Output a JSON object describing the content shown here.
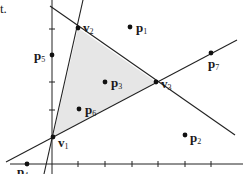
{
  "fragment_text": "t.",
  "polygon": {
    "fill": "#e6e6e6",
    "vertices": [
      {
        "name": "v",
        "sub": "1",
        "x": 53,
        "y": 137
      },
      {
        "name": "v",
        "sub": "2",
        "x": 78,
        "y": 28
      },
      {
        "name": "v",
        "sub": "3",
        "x": 156,
        "y": 82
      }
    ]
  },
  "lines": [
    {
      "id": "line-v1-v2",
      "x1": 44,
      "y1": 174,
      "x2": 83,
      "y2": 0
    },
    {
      "id": "line-v2-v3",
      "x1": 50,
      "y1": 6,
      "x2": 235,
      "y2": 135
    },
    {
      "id": "line-v1-v3",
      "x1": 6,
      "y1": 162,
      "x2": 237,
      "y2": 40
    }
  ],
  "axes": {
    "y_axis": {
      "x": 52,
      "y1": 0,
      "y2": 174,
      "ticks": [
        29,
        82,
        110
      ]
    },
    "x_axis": {
      "y": 164,
      "x1": 10,
      "x2": 243,
      "ticks": [
        78,
        105,
        132,
        158,
        185,
        211
      ]
    }
  },
  "points": [
    {
      "name": "p",
      "sub": "1",
      "x": 130,
      "y": 27,
      "lx": 136,
      "ly": 32
    },
    {
      "name": "p",
      "sub": "2",
      "x": 185,
      "y": 135,
      "lx": 190,
      "ly": 142
    },
    {
      "name": "p",
      "sub": "3",
      "x": 105,
      "y": 82,
      "lx": 111,
      "ly": 87
    },
    {
      "name": "p",
      "sub": "4",
      "x": 27,
      "y": 164,
      "lx": 17,
      "ly": 176
    },
    {
      "name": "p",
      "sub": "5",
      "x": 52,
      "y": 55,
      "lx": 34,
      "ly": 60
    },
    {
      "name": "p",
      "sub": "6",
      "x": 79,
      "y": 109,
      "lx": 85,
      "ly": 114
    },
    {
      "name": "p",
      "sub": "7",
      "x": 211,
      "y": 53,
      "lx": 208,
      "ly": 68
    }
  ],
  "vertex_labels": [
    {
      "name": "v",
      "sub": "1",
      "lx": 58,
      "ly": 147
    },
    {
      "name": "v",
      "sub": "2",
      "lx": 83,
      "ly": 32
    },
    {
      "name": "v",
      "sub": "3",
      "lx": 161,
      "ly": 88
    }
  ]
}
